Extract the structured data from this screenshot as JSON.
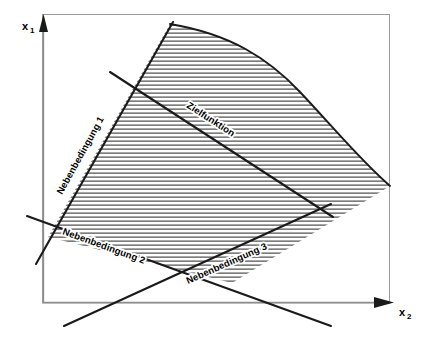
{
  "figure": {
    "type": "linear-programming-diagram",
    "background_color": "#ffffff",
    "ink_color": "#1a1a1a",
    "hatch_color": "#2b2b2b",
    "axes": {
      "vertical": {
        "label": "x",
        "subscript": "1"
      },
      "horizontal": {
        "label": "x",
        "subscript": "2"
      }
    },
    "labels": {
      "objective": "Zielfunktion",
      "constraint_1": "Nebenbedingung 1",
      "constraint_2": "Nebenbedingung 2",
      "constraint_3": "Nebenbedingung 3"
    },
    "geometry": {
      "frame": {
        "x": 42,
        "y": 14,
        "width": 348,
        "height": 289
      },
      "y_axis": {
        "x1": 43,
        "y1": 303,
        "x2": 43,
        "y2": 22
      },
      "x_axis": {
        "x1": 43,
        "y1": 303,
        "x2": 392,
        "y2": 303
      },
      "constraint_1_line": {
        "x1": 36,
        "y1": 263,
        "x2": 172,
        "y2": 23
      },
      "constraint_2_line": {
        "x1": 27,
        "y1": 217,
        "x2": 330,
        "y2": 325
      },
      "constraint_3_line": {
        "x1": 64,
        "y1": 325,
        "x2": 330,
        "y2": 205
      },
      "objective_line": {
        "x1": 110,
        "y1": 72,
        "x2": 332,
        "y2": 216
      },
      "region_apex": {
        "x": 170,
        "y": 24
      },
      "region_right_vertex": {
        "x": 390,
        "y": 186
      },
      "region_bottom_vertex": {
        "x": 232,
        "y": 283
      },
      "region_left_vertex": {
        "x": 48,
        "y": 237
      },
      "hatch_spacing_px": 4
    }
  }
}
